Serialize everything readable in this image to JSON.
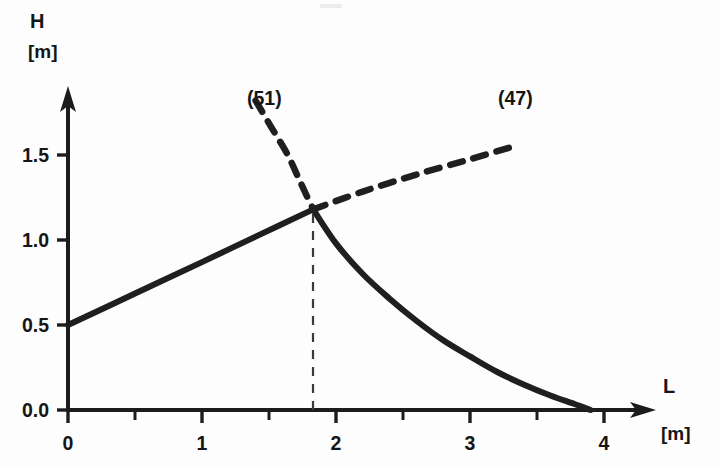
{
  "chart_data": {
    "type": "line",
    "title": "",
    "xlabel": "L",
    "ylabel": "H",
    "x_unit": "[m]",
    "y_unit": "[m]",
    "xlim": [
      0,
      4.35
    ],
    "ylim": [
      0.0,
      1.85
    ],
    "grid": false,
    "legend_position": "inline-annotation",
    "x_ticks": [
      0,
      1,
      2,
      3,
      4
    ],
    "x_tick_labels": [
      "0",
      "1",
      "2",
      "3",
      "4"
    ],
    "x_minor_ticks": [
      0.5,
      1.5,
      2.5,
      3.5
    ],
    "y_ticks": [
      0.0,
      0.5,
      1.0,
      1.5
    ],
    "y_tick_labels": [
      "0.0",
      "0.5",
      "1.0",
      "1.5"
    ],
    "intersection": {
      "x": 1.83,
      "y": 1.18
    },
    "series": [
      {
        "name": "(47)",
        "label": "(47)",
        "style": "rising branch: solid below intersection, dashed above",
        "solid_points": [
          [
            0.0,
            0.5
          ],
          [
            0.5,
            0.685
          ],
          [
            1.0,
            0.87
          ],
          [
            1.4,
            1.02
          ],
          [
            1.83,
            1.18
          ]
        ],
        "dashed_points": [
          [
            1.83,
            1.18
          ],
          [
            2.2,
            1.285
          ],
          [
            2.6,
            1.385
          ],
          [
            3.0,
            1.475
          ],
          [
            3.3,
            1.545
          ]
        ]
      },
      {
        "name": "(51)",
        "label": "(51)",
        "style": "falling branch: dashed above intersection, solid below",
        "dashed_points": [
          [
            1.4,
            1.82
          ],
          [
            1.52,
            1.66
          ],
          [
            1.64,
            1.5
          ],
          [
            1.74,
            1.33
          ],
          [
            1.83,
            1.18
          ]
        ],
        "solid_points": [
          [
            1.83,
            1.18
          ],
          [
            2.0,
            0.98
          ],
          [
            2.2,
            0.8
          ],
          [
            2.4,
            0.655
          ],
          [
            2.6,
            0.525
          ],
          [
            2.8,
            0.41
          ],
          [
            3.0,
            0.315
          ],
          [
            3.2,
            0.225
          ],
          [
            3.4,
            0.15
          ],
          [
            3.6,
            0.085
          ],
          [
            3.78,
            0.035
          ],
          [
            3.9,
            0.0
          ]
        ]
      }
    ],
    "annotations": [
      {
        "text": "(51)",
        "x": 1.33,
        "y": 1.72,
        "role": "curve-label"
      },
      {
        "text": "(47)",
        "x": 3.22,
        "y": 1.72,
        "role": "curve-label"
      }
    ],
    "helper_lines": [
      {
        "role": "intersection-dropline",
        "style": "dashed-vertical",
        "x": 1.83,
        "y_from": 0.0,
        "y_to": 1.18
      }
    ]
  },
  "axes": {
    "y_axis_name": "H",
    "y_axis_unit": "[m]",
    "x_axis_name": "L",
    "x_axis_unit": "[m]"
  }
}
